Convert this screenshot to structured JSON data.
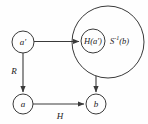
{
  "diagram": {
    "background_color": "#fefefe",
    "stroke_color": "#3a3a3a",
    "text_color": "#1a1a1a",
    "nodes": [
      {
        "id": "a-prime",
        "label": "a′",
        "cx": 23,
        "cy": 42,
        "r": 11
      },
      {
        "id": "a",
        "label": "a",
        "cx": 23,
        "cy": 104,
        "r": 10
      },
      {
        "id": "b",
        "label": "b",
        "cx": 96,
        "cy": 104,
        "r": 10
      },
      {
        "id": "h-a-prime",
        "label": "H(a′)",
        "cx": 93,
        "cy": 41,
        "r": 12
      }
    ],
    "sets": [
      {
        "id": "s-inverse-b",
        "label_base": "S",
        "label_sup": "-1",
        "label_tail": "(b)",
        "label_full": "S⁻¹(b)",
        "cx": 108,
        "cy": 42,
        "r": 36,
        "label_x": 108,
        "label_y": 42
      }
    ],
    "edges": [
      {
        "id": "a-prime-to-h",
        "label": "",
        "from": "a-prime",
        "to": "h-a-prime"
      },
      {
        "id": "a-prime-to-a",
        "label": "R",
        "from": "a-prime",
        "to": "a",
        "label_x": 14,
        "label_y": 71
      },
      {
        "id": "a-to-b",
        "label": "H",
        "from": "a",
        "to": "b",
        "label_x": 60,
        "label_y": 116
      },
      {
        "id": "set-to-b",
        "label": "",
        "from": "s-inverse-b",
        "to": "b"
      }
    ]
  }
}
